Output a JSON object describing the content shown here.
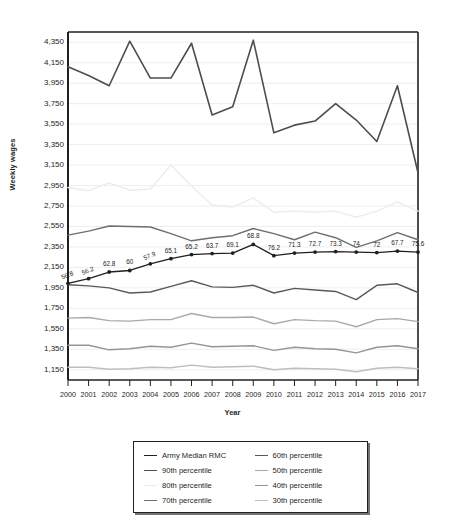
{
  "chart_data": {
    "type": "line",
    "title": "",
    "xlabel": "Year",
    "ylabel": "Weekly wages",
    "x": [
      2000,
      2001,
      2002,
      2003,
      2004,
      2005,
      2006,
      2007,
      2008,
      2009,
      2010,
      2011,
      2012,
      2013,
      2014,
      2015,
      2016,
      2017
    ],
    "xtick_labels": [
      "2000",
      "2001",
      "2002",
      "2003",
      "2004",
      "2005",
      "2006",
      "2007",
      "2008",
      "2009",
      "2010",
      "2011",
      "2012",
      "2013",
      "2014",
      "2015",
      "2016",
      "2017"
    ],
    "ylim": [
      1050,
      4450
    ],
    "ytick_labels": [
      "4,350",
      "4,150",
      "3,950",
      "3,750",
      "3,550",
      "3,350",
      "3,150",
      "2,950",
      "2,750",
      "2,550",
      "2,350",
      "2,150",
      "1,950",
      "1,750",
      "1,550",
      "1,350",
      "1,150"
    ],
    "yticks": [
      4350,
      4150,
      3950,
      3750,
      3550,
      3350,
      3150,
      2950,
      2750,
      2550,
      2350,
      2150,
      1950,
      1750,
      1550,
      1350,
      1150
    ],
    "grid": true,
    "legend_position": "bottom",
    "series": [
      {
        "name": "Army Median RMC",
        "color": "#231f20",
        "width": 1.3,
        "markers": true,
        "values": [
          1995,
          2040,
          2105,
          2120,
          2185,
          2235,
          2275,
          2285,
          2290,
          2375,
          2265,
          2290,
          2300,
          2305,
          2300,
          2295,
          2310,
          2300
        ],
        "point_labels": [
          "56.8",
          "56.2",
          "62.8",
          "60",
          "57.9",
          "65.1",
          "65.2",
          "63.7",
          "69.1",
          "68.8",
          "76.2",
          "71.3",
          "72.7",
          "73.3",
          "74",
          "72",
          "67.7",
          "75.6"
        ]
      },
      {
        "name": "90th percentile",
        "color": "#4d4d4f",
        "width": 1.6,
        "markers": false,
        "values": [
          4110,
          4025,
          3925,
          4360,
          4000,
          4000,
          4340,
          3640,
          3720,
          4370,
          3465,
          3540,
          3580,
          3750,
          3590,
          3380,
          3925,
          3075
        ]
      },
      {
        "name": "80th percentile",
        "color": "#ededee",
        "width": 1.5,
        "markers": false,
        "values": [
          2930,
          2900,
          2975,
          2905,
          2915,
          3150,
          2945,
          2760,
          2740,
          2830,
          2690,
          2700,
          2690,
          2700,
          2640,
          2700,
          2790,
          2700
        ]
      },
      {
        "name": "70th percentile",
        "color": "#6d6e71",
        "width": 1.4,
        "markers": false,
        "values": [
          2465,
          2505,
          2555,
          2550,
          2545,
          2480,
          2410,
          2440,
          2460,
          2530,
          2480,
          2420,
          2495,
          2440,
          2345,
          2410,
          2490,
          2420
        ]
      },
      {
        "name": "60th percentile",
        "color": "#58595b",
        "width": 1.4,
        "markers": false,
        "values": [
          1980,
          1970,
          1950,
          1900,
          1910,
          1965,
          2020,
          1960,
          1955,
          1975,
          1900,
          1945,
          1930,
          1915,
          1835,
          1975,
          1990,
          1905
        ]
      },
      {
        "name": "50th percentile",
        "color": "#a7a9ac",
        "width": 1.4,
        "markers": false,
        "values": [
          1655,
          1660,
          1630,
          1625,
          1640,
          1640,
          1700,
          1660,
          1660,
          1665,
          1600,
          1640,
          1630,
          1625,
          1570,
          1640,
          1650,
          1620
        ]
      },
      {
        "name": "40th percentile",
        "color": "#939598",
        "width": 1.4,
        "markers": false,
        "values": [
          1390,
          1390,
          1345,
          1355,
          1380,
          1370,
          1410,
          1375,
          1380,
          1385,
          1340,
          1370,
          1355,
          1350,
          1315,
          1370,
          1385,
          1355
        ]
      },
      {
        "name": "30th percentile",
        "color": "#bcbec0",
        "width": 1.4,
        "markers": false,
        "values": [
          1175,
          1175,
          1155,
          1160,
          1175,
          1170,
          1195,
          1175,
          1180,
          1185,
          1150,
          1165,
          1160,
          1155,
          1130,
          1165,
          1175,
          1160
        ]
      }
    ]
  },
  "legend": {
    "items": [
      {
        "label": "Army Median RMC",
        "color": "#231f20"
      },
      {
        "label": "60th percentile",
        "color": "#58595b"
      },
      {
        "label": "90th percentile",
        "color": "#4d4d4f"
      },
      {
        "label": "50th percentile",
        "color": "#a7a9ac"
      },
      {
        "label": "80th percentile",
        "color": "#ededee"
      },
      {
        "label": "40th percentile",
        "color": "#939598"
      },
      {
        "label": "70th percentile",
        "color": "#6d6e71"
      },
      {
        "label": "30th percentile",
        "color": "#bcbec0"
      }
    ]
  }
}
